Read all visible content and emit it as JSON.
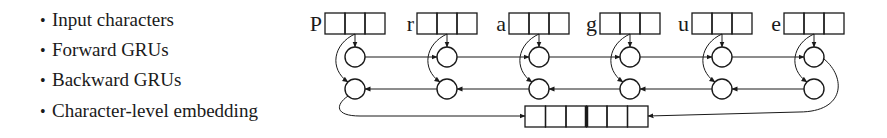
{
  "legend": {
    "bullet": "•",
    "items": [
      {
        "label": "Input characters",
        "top": 8
      },
      {
        "label": "Forward GRUs",
        "top": 38
      },
      {
        "label": "Backward GRUs",
        "top": 68
      },
      {
        "label": "Character-level embedding",
        "top": 99
      }
    ]
  },
  "diagram": {
    "characters": [
      "P",
      "r",
      "a",
      "g",
      "u",
      "e"
    ],
    "cells_per_character": 3,
    "embedding_cells": 6,
    "stroke_color": "#1a1a1a"
  }
}
